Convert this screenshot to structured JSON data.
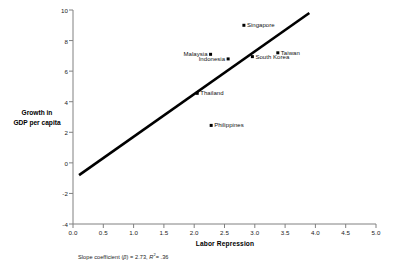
{
  "chart_data": {
    "type": "scatter",
    "title": "",
    "xlabel": "Labor Repression",
    "ylabel": "Growth in GDP per capita",
    "ylabel_line1": "Growth in",
    "ylabel_line2": "GDP per capita",
    "xlim": [
      0.0,
      5.0
    ],
    "ylim": [
      -4,
      10
    ],
    "xticks": [
      "0.0",
      "0.5",
      "1.0",
      "1.5",
      "2.0",
      "2.5",
      "3.0",
      "3.5",
      "4.0",
      "4.5",
      "5.0"
    ],
    "yticks": [
      "10",
      "8",
      "6",
      "4",
      "2",
      "0",
      "-2",
      "-4"
    ],
    "grid": false,
    "legend": "none",
    "points": [
      {
        "label": "Singapore",
        "x": 2.82,
        "y": 9.0,
        "label_side": "right"
      },
      {
        "label": "Malaysia",
        "x": 2.27,
        "y": 7.1,
        "label_side": "left"
      },
      {
        "label": "Taiwan",
        "x": 3.38,
        "y": 7.2,
        "label_side": "right"
      },
      {
        "label": "South Korea",
        "x": 2.96,
        "y": 6.95,
        "label_side": "right"
      },
      {
        "label": "Indonesia",
        "x": 2.56,
        "y": 6.8,
        "label_side": "left"
      },
      {
        "label": "Thailand",
        "x": 2.05,
        "y": 4.55,
        "label_side": "right"
      },
      {
        "label": "Philippines",
        "x": 2.28,
        "y": 2.45,
        "label_side": "right"
      }
    ],
    "fit_line": {
      "x_start": 0.1,
      "y_start": -0.8,
      "x_end": 3.9,
      "y_end": 9.8
    },
    "annotation": {
      "prefix": "Slope coefficient (",
      "beta_symbol": "β",
      "mid": ") = 2.73, ",
      "r_symbol": "R",
      "r_exponent": "2",
      "suffix": "= .36"
    }
  }
}
